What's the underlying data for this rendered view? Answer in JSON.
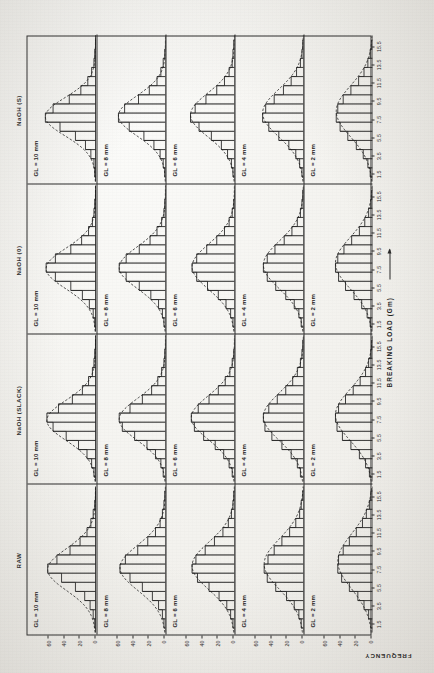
{
  "figure": {
    "y_axis_title": "FREQUENCY",
    "x_axis_title": "BREAKING LOAD (Gm)",
    "column_titles": [
      "RAW",
      "NaOH (SLACK)",
      "NaOH (0)",
      "NaOH (S)"
    ],
    "row_labels": [
      "GL = 10 mm",
      "GL = 8 mm",
      "GL = 6 mm",
      "GL = 4 mm",
      "GL = 2 mm"
    ],
    "x_ticks": [
      "1.5",
      "3.5",
      "5.5",
      "7.5",
      "9.5",
      "11.5",
      "13.5",
      "15.5"
    ],
    "y_ticks": [
      "0",
      "20",
      "40",
      "60"
    ]
  },
  "chart_data": {
    "type": "bar",
    "xlabel": "BREAKING LOAD (Gm)",
    "ylabel": "FREQUENCY",
    "xlim": [
      0.5,
      16.5
    ],
    "ylim": [
      0,
      70
    ],
    "grid": false,
    "legend": "none",
    "bin_centers": [
      1.5,
      2.5,
      3.5,
      4.5,
      5.5,
      6.5,
      7.5,
      8.5,
      9.5,
      10.5,
      11.5,
      12.5,
      13.5,
      14.5,
      15.5
    ],
    "x_tick_labels": [
      "1.5",
      "3.5",
      "5.5",
      "7.5",
      "9.5",
      "11.5",
      "13.5",
      "15.5"
    ],
    "y_tick_values": [
      0,
      20,
      40,
      60
    ],
    "overlay": "fitted normal curve (dashed)",
    "panels": [
      {
        "column": "RAW",
        "row": "GL = 10 mm",
        "values": [
          1,
          3,
          7,
          14,
          26,
          44,
          62,
          50,
          33,
          20,
          11,
          6,
          3,
          1,
          0
        ],
        "mean": 7.4,
        "sd": 2.3
      },
      {
        "column": "RAW",
        "row": "GL = 8 mm",
        "values": [
          2,
          4,
          9,
          17,
          30,
          46,
          59,
          52,
          36,
          23,
          13,
          7,
          4,
          2,
          1
        ],
        "mean": 7.6,
        "sd": 2.5
      },
      {
        "column": "RAW",
        "row": "GL = 6 mm",
        "values": [
          2,
          5,
          10,
          20,
          33,
          48,
          55,
          50,
          38,
          26,
          15,
          8,
          4,
          2,
          1
        ],
        "mean": 7.8,
        "sd": 2.6
      },
      {
        "column": "RAW",
        "row": "GL = 4 mm",
        "values": [
          3,
          6,
          12,
          22,
          36,
          47,
          51,
          46,
          38,
          28,
          18,
          10,
          5,
          3,
          1
        ],
        "mean": 8.0,
        "sd": 2.8
      },
      {
        "column": "RAW",
        "row": "GL = 2 mm",
        "values": [
          2,
          5,
          11,
          19,
          30,
          40,
          45,
          44,
          38,
          30,
          21,
          13,
          8,
          4,
          2
        ],
        "mean": 8.3,
        "sd": 3.0
      },
      {
        "column": "NaOH (SLACK)",
        "row": "GL = 10 mm",
        "values": [
          2,
          5,
          11,
          22,
          38,
          55,
          63,
          48,
          30,
          17,
          9,
          4,
          2,
          1,
          0
        ],
        "mean": 7.2,
        "sd": 2.2
      },
      {
        "column": "NaOH (SLACK)",
        "row": "GL = 8 mm",
        "values": [
          3,
          6,
          13,
          24,
          40,
          56,
          60,
          46,
          30,
          18,
          10,
          5,
          2,
          1,
          0
        ],
        "mean": 7.3,
        "sd": 2.3
      },
      {
        "column": "NaOH (SLACK)",
        "row": "GL = 6 mm",
        "values": [
          3,
          7,
          14,
          25,
          40,
          52,
          56,
          47,
          33,
          21,
          12,
          6,
          3,
          1,
          0
        ],
        "mean": 7.5,
        "sd": 2.4
      },
      {
        "column": "NaOH (SLACK)",
        "row": "GL = 4 mm",
        "values": [
          4,
          8,
          16,
          28,
          41,
          50,
          52,
          45,
          34,
          23,
          14,
          8,
          4,
          2,
          1
        ],
        "mean": 7.6,
        "sd": 2.6
      },
      {
        "column": "NaOH (SLACK)",
        "row": "GL = 2 mm",
        "values": [
          4,
          9,
          17,
          28,
          39,
          46,
          48,
          44,
          35,
          25,
          16,
          9,
          5,
          2,
          1
        ],
        "mean": 7.8,
        "sd": 2.8
      },
      {
        "column": "NaOH (0)",
        "row": "GL = 10 mm",
        "values": [
          1,
          3,
          8,
          17,
          32,
          52,
          64,
          52,
          32,
          18,
          9,
          4,
          2,
          1,
          0
        ],
        "mean": 7.4,
        "sd": 2.2
      },
      {
        "column": "NaOH (0)",
        "row": "GL = 8 mm",
        "values": [
          2,
          4,
          9,
          19,
          34,
          51,
          60,
          51,
          34,
          20,
          11,
          5,
          2,
          1,
          0
        ],
        "mean": 7.5,
        "sd": 2.3
      },
      {
        "column": "NaOH (0)",
        "row": "GL = 6 mm",
        "values": [
          2,
          5,
          11,
          21,
          35,
          49,
          55,
          49,
          36,
          23,
          13,
          7,
          3,
          1,
          0
        ],
        "mean": 7.6,
        "sd": 2.5
      },
      {
        "column": "NaOH (0)",
        "row": "GL = 4 mm",
        "values": [
          3,
          6,
          12,
          23,
          36,
          47,
          52,
          47,
          37,
          25,
          15,
          8,
          4,
          2,
          1
        ],
        "mean": 7.8,
        "sd": 2.6
      },
      {
        "column": "NaOH (0)",
        "row": "GL = 2 mm",
        "values": [
          3,
          7,
          14,
          24,
          35,
          44,
          48,
          45,
          37,
          27,
          17,
          10,
          5,
          2,
          1
        ],
        "mean": 8.0,
        "sd": 2.8
      },
      {
        "column": "NaOH (S)",
        "row": "GL = 10 mm",
        "values": [
          1,
          2,
          6,
          13,
          26,
          46,
          65,
          55,
          34,
          19,
          10,
          5,
          2,
          1,
          0
        ],
        "mean": 7.6,
        "sd": 2.1
      },
      {
        "column": "NaOH (S)",
        "row": "GL = 8 mm",
        "values": [
          1,
          3,
          7,
          15,
          28,
          47,
          61,
          53,
          35,
          21,
          11,
          6,
          3,
          1,
          0
        ],
        "mean": 7.7,
        "sd": 2.2
      },
      {
        "column": "NaOH (S)",
        "row": "GL = 6 mm",
        "values": [
          2,
          4,
          9,
          17,
          30,
          46,
          57,
          51,
          37,
          23,
          13,
          7,
          3,
          2,
          1
        ],
        "mean": 7.8,
        "sd": 2.4
      },
      {
        "column": "NaOH (S)",
        "row": "GL = 4 mm",
        "values": [
          2,
          5,
          10,
          19,
          32,
          45,
          53,
          49,
          38,
          26,
          16,
          9,
          4,
          2,
          1
        ],
        "mean": 8.0,
        "sd": 2.6
      },
      {
        "column": "NaOH (S)",
        "row": "GL = 2 mm",
        "values": [
          3,
          6,
          12,
          21,
          32,
          42,
          47,
          45,
          38,
          28,
          18,
          11,
          6,
          3,
          1
        ],
        "mean": 8.2,
        "sd": 2.8
      }
    ]
  }
}
